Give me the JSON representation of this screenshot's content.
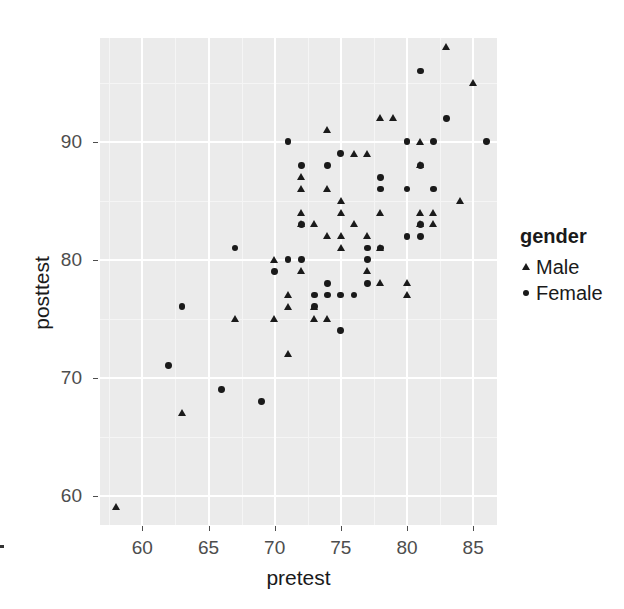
{
  "chart_data": {
    "type": "scatter",
    "title": "",
    "xlabel": "pretest",
    "ylabel": "posttest",
    "xlim": [
      56.8,
      86.8
    ],
    "ylim": [
      57.5,
      98.8
    ],
    "xticks": [
      60,
      65,
      70,
      75,
      80,
      85
    ],
    "yticks": [
      60,
      70,
      80,
      90
    ],
    "xtick_labels": [
      "60",
      "65",
      "70",
      "75",
      "80",
      "85"
    ],
    "ytick_labels": [
      "60",
      "70",
      "80",
      "90"
    ],
    "grid": true,
    "legend": {
      "title": "gender",
      "position": "right",
      "entries": [
        {
          "label": "Male",
          "marker": "triangle"
        },
        {
          "label": "Female",
          "marker": "circle"
        }
      ]
    },
    "series": [
      {
        "name": "Male",
        "marker": "triangle",
        "color": "#1a1a1a",
        "points": [
          [
            58,
            59
          ],
          [
            63,
            67
          ],
          [
            67,
            75
          ],
          [
            70,
            75
          ],
          [
            71,
            72
          ],
          [
            71,
            77
          ],
          [
            71,
            76
          ],
          [
            70,
            80
          ],
          [
            72,
            79
          ],
          [
            72,
            86
          ],
          [
            72,
            87
          ],
          [
            72,
            84
          ],
          [
            72,
            83
          ],
          [
            73,
            75
          ],
          [
            73,
            76
          ],
          [
            73,
            83
          ],
          [
            74,
            82
          ],
          [
            74,
            91
          ],
          [
            74,
            75
          ],
          [
            74,
            86
          ],
          [
            75,
            81
          ],
          [
            75,
            82
          ],
          [
            75,
            84
          ],
          [
            75,
            85
          ],
          [
            76,
            83
          ],
          [
            76,
            89
          ],
          [
            77,
            79
          ],
          [
            77,
            82
          ],
          [
            77,
            89
          ],
          [
            78,
            78
          ],
          [
            78,
            81
          ],
          [
            78,
            84
          ],
          [
            78,
            92
          ],
          [
            79,
            92
          ],
          [
            80,
            77
          ],
          [
            80,
            78
          ],
          [
            81,
            88
          ],
          [
            81,
            90
          ],
          [
            81,
            83
          ],
          [
            81,
            84
          ],
          [
            82,
            83
          ],
          [
            82,
            84
          ],
          [
            83,
            98
          ],
          [
            84,
            85
          ],
          [
            85,
            95
          ]
        ]
      },
      {
        "name": "Female",
        "marker": "circle",
        "color": "#1a1a1a",
        "points": [
          [
            62,
            71
          ],
          [
            63,
            76
          ],
          [
            66,
            69
          ],
          [
            67,
            81
          ],
          [
            69,
            68
          ],
          [
            70,
            79
          ],
          [
            71,
            90
          ],
          [
            71,
            80
          ],
          [
            72,
            80
          ],
          [
            72,
            88
          ],
          [
            72,
            83
          ],
          [
            73,
            77
          ],
          [
            73,
            76
          ],
          [
            74,
            78
          ],
          [
            74,
            88
          ],
          [
            74,
            77
          ],
          [
            75,
            74
          ],
          [
            75,
            77
          ],
          [
            75,
            89
          ],
          [
            76,
            77
          ],
          [
            77,
            78
          ],
          [
            77,
            80
          ],
          [
            77,
            81
          ],
          [
            78,
            86
          ],
          [
            78,
            87
          ],
          [
            78,
            81
          ],
          [
            80,
            82
          ],
          [
            80,
            86
          ],
          [
            80,
            90
          ],
          [
            81,
            82
          ],
          [
            81,
            83
          ],
          [
            81,
            88
          ],
          [
            81,
            96
          ],
          [
            82,
            86
          ],
          [
            82,
            90
          ],
          [
            83,
            92
          ],
          [
            86,
            90
          ]
        ]
      }
    ]
  },
  "axis": {
    "x_title": "pretest",
    "y_title": "posttest"
  }
}
